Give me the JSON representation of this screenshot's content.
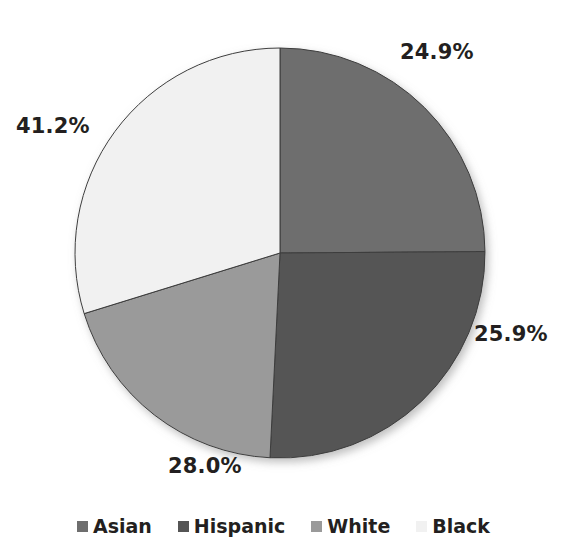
{
  "chart_data": {
    "type": "pie",
    "title": "",
    "subtitle": "",
    "xlabel": "",
    "ylabel": "",
    "legend_position": "bottom",
    "grid": false,
    "categories": [
      "Asian",
      "Hispanic",
      "White",
      "Black"
    ],
    "values": [
      24.9,
      25.9,
      28.0,
      41.2
    ],
    "data_labels": [
      "24.9%",
      "25.9%",
      "28.0%",
      "41.2%"
    ],
    "slice_angles_deg": [
      89.6,
      93.2,
      70.0,
      107.2
    ],
    "slice_colors": [
      "#6e6e6e",
      "#555555",
      "#9a9a9a",
      "#f1f1f1"
    ],
    "slices": [
      {
        "name": "Asian",
        "label": "24.9%",
        "value": 24.9,
        "color": "#6e6e6e",
        "start_deg": 0.0,
        "sweep_deg": 89.6
      },
      {
        "name": "Hispanic",
        "label": "25.9%",
        "value": 25.9,
        "color": "#555555",
        "start_deg": 89.6,
        "sweep_deg": 93.2
      },
      {
        "name": "White",
        "label": "28.0%",
        "value": 28.0,
        "color": "#9a9a9a",
        "start_deg": 182.8,
        "sweep_deg": 70.0
      },
      {
        "name": "Black",
        "label": "41.2%",
        "value": 41.2,
        "color": "#f1f1f1",
        "start_deg": 252.8,
        "sweep_deg": 107.2
      }
    ]
  },
  "labels": {
    "asian_pct": "24.9%",
    "hispanic_pct": "25.9%",
    "white_pct": "28.0%",
    "black_pct": "41.2%"
  },
  "legend": {
    "items": [
      {
        "label": "Asian",
        "color": "#6e6e6e"
      },
      {
        "label": "Hispanic",
        "color": "#555555"
      },
      {
        "label": "White",
        "color": "#9a9a9a"
      },
      {
        "label": "Black",
        "color": "#f1f1f1"
      }
    ]
  },
  "style": {
    "background": "#ffffff",
    "text_color": "#231f20",
    "outline_color": "#3d3d3d",
    "center_x": 280,
    "center_y": 253,
    "radius": 205
  }
}
